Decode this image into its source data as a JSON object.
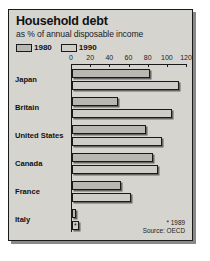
{
  "chart_data": {
    "type": "bar",
    "orientation": "horizontal",
    "title": "Household debt",
    "subtitle": "as % of annual disposable income",
    "xlabel": "",
    "ylabel": "",
    "xlim": [
      0,
      120
    ],
    "ticks": [
      0,
      20,
      40,
      60,
      80,
      100,
      120
    ],
    "grid": false,
    "legend_position": "top-left",
    "categories": [
      "Japan",
      "Britain",
      "United States",
      "Canada",
      "France",
      "Italy"
    ],
    "series": [
      {
        "name": "1980",
        "values": [
          82,
          48,
          78,
          85,
          52,
          4
        ]
      },
      {
        "name": "1990",
        "values": [
          113,
          105,
          95,
          90,
          62,
          7
        ]
      }
    ],
    "annotations": [
      "* 1989"
    ],
    "source": "Source: OECD",
    "italy_note_marker": "*"
  },
  "card": {
    "title": "Household debt",
    "subtitle": "as % of annual disposable income"
  },
  "legend": {
    "items": [
      {
        "label": "1980"
      },
      {
        "label": "1990"
      }
    ]
  },
  "axis": {
    "ticks": [
      "0",
      "20",
      "40",
      "60",
      "80",
      "100",
      "120"
    ]
  },
  "rows": [
    {
      "label": "Japan"
    },
    {
      "label": "Britain"
    },
    {
      "label": "United States"
    },
    {
      "label": "Canada"
    },
    {
      "label": "France"
    },
    {
      "label": "Italy"
    }
  ],
  "footnote": {
    "asterisk": "* 1989",
    "source": "Source: OECD"
  },
  "colors": {
    "card_bg": "#d6d4cf",
    "bar_1980": "#b9b7b2",
    "bar_1990": "#cfcdc8",
    "outline": "#1a1a1a"
  }
}
